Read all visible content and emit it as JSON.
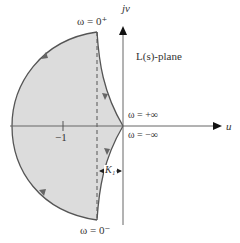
{
  "diagram": {
    "plane_label": "L(s)-plane",
    "axis_vertical_label": "jv",
    "axis_horizontal_label": "u",
    "tick_label": "−1",
    "labels": {
      "omega_0_plus": "ω = 0⁺",
      "omega_0_minus": "ω = 0⁻",
      "omega_plus_inf": "ω = +∞",
      "omega_minus_inf": "ω = −∞",
      "k1": "K₁"
    },
    "colors": {
      "fill": "#dcdcdc",
      "curve": "#555555",
      "axis": "#666666"
    }
  }
}
